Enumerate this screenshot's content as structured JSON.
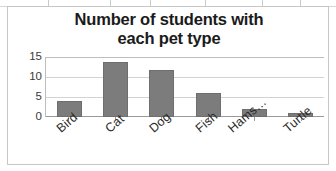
{
  "capture": {
    "top_strip": {
      "description": "partial-spreadsheet-row",
      "separator_positions": [
        48,
        110,
        150,
        205,
        262,
        300
      ]
    }
  },
  "chart_data": {
    "type": "bar",
    "title": "Number of students with each pet type",
    "title_lines": [
      "Number of students with",
      "each pet type"
    ],
    "categories": [
      "Bird",
      "Cat",
      "Dog",
      "Fish",
      "Hams…",
      "Turtle"
    ],
    "category_full_names": [
      "Bird",
      "Cat",
      "Dog",
      "Fish",
      "Hamster",
      "Turtle"
    ],
    "values": [
      4,
      14,
      12,
      6,
      2,
      1
    ],
    "xlabel": "",
    "ylabel": "",
    "ylim": [
      0,
      15
    ],
    "yticks": [
      15,
      10,
      5,
      0
    ],
    "grid": true,
    "legend": false,
    "bar_color": "#7c7c7c",
    "gridline_color": "#d3d3d3",
    "plot_background": "#ffffff",
    "title_color": "#1b1b1b",
    "category_label_rotation_deg": -41
  }
}
